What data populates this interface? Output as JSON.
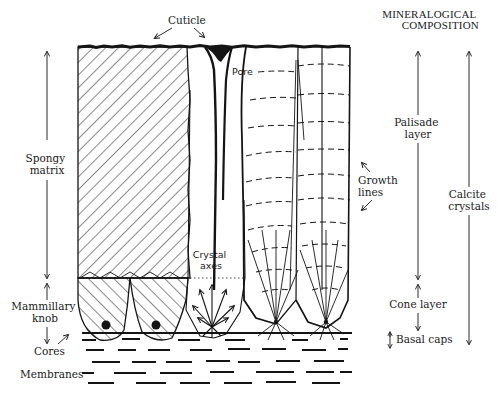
{
  "figure": {
    "type": "cross-section diagram of eggshell structure",
    "ink_color": "#141414",
    "background": "#ffffff"
  },
  "labels": {
    "cuticle": "Cuticle",
    "pore": "Pore",
    "spongy_matrix": [
      "Spongy",
      "matrix"
    ],
    "crystal_axes": [
      "Crystal",
      "axes"
    ],
    "growth_lines": [
      "Growth",
      "lines"
    ],
    "mammillary_knob": [
      "Mammillary",
      "knob"
    ],
    "cores": "Cores",
    "membranes": "Membranes"
  },
  "mineralogical_composition": {
    "heading": [
      "MINERALOGICAL",
      "COMPOSITION"
    ],
    "layers": {
      "palisade_layer": [
        "Palisade",
        "layer"
      ],
      "cone_layer": "Cone layer",
      "basal_caps": "Basal caps"
    },
    "overall": [
      "Calcite",
      "crystals"
    ]
  }
}
